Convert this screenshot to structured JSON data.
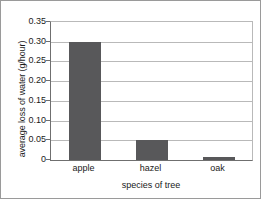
{
  "chart_data": {
    "type": "bar",
    "title": "",
    "xlabel": "species of tree",
    "ylabel": "average loss of water (g/hour)",
    "categories": [
      "apple",
      "hazel",
      "oak"
    ],
    "values": [
      0.3,
      0.05,
      0.007
    ],
    "series": [
      {
        "name": "average loss of water",
        "values": [
          0.3,
          0.05,
          0.007
        ]
      }
    ],
    "ylim": [
      0,
      0.35
    ],
    "yticks": [
      0,
      0.05,
      0.1,
      0.15,
      0.2,
      0.25,
      0.3,
      0.35
    ],
    "yticklabels": [
      "0",
      "0.05",
      "0.10",
      "0.15",
      "0.20",
      "0.25",
      "0.30",
      "0.35"
    ],
    "grid": "horizontal",
    "legend": "none",
    "bar_color": "#58585a",
    "gridline_color": "#b9b9b9",
    "axis_color": "#6f6f6f"
  }
}
